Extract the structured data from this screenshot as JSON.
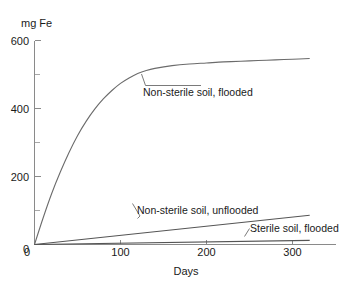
{
  "chart_data": {
    "type": "line",
    "title": "",
    "subtitle": "",
    "xlabel": "Days",
    "ylabel": "mg Fe",
    "xlim": [
      0,
      330
    ],
    "ylim": [
      0,
      620
    ],
    "grid": false,
    "legend_position": "inline-annotations",
    "x_ticks": [
      0,
      100,
      200,
      300
    ],
    "x_tick_labels": [
      "0",
      "100",
      "200",
      "300"
    ],
    "y_ticks": [
      0,
      200,
      400,
      600
    ],
    "y_tick_labels": [
      "0",
      "200",
      "400",
      "600"
    ],
    "y_minor_ticks": [
      100,
      300,
      500
    ],
    "series": [
      {
        "name": "Non-sterile soil, flooded",
        "label": "Non-sterile soil, flooded",
        "x": [
          0,
          10,
          20,
          30,
          40,
          50,
          60,
          70,
          80,
          90,
          100,
          110,
          120,
          130,
          140,
          160,
          180,
          200,
          220,
          240,
          260,
          280,
          300,
          320
        ],
        "values": [
          0,
          78,
          150,
          213,
          270,
          320,
          362,
          398,
          428,
          453,
          474,
          490,
          503,
          512,
          518,
          526,
          531,
          534,
          537,
          539,
          541,
          543,
          545,
          547
        ]
      },
      {
        "name": "Non-sterile soil, unflooded",
        "label": "Non-sterile soil, unflooded",
        "x": [
          0,
          320
        ],
        "values": [
          0,
          86
        ]
      },
      {
        "name": "Sterile soil, flooded",
        "label": "Sterile soil, flooded",
        "x": [
          0,
          320
        ],
        "values": [
          0,
          12
        ]
      }
    ],
    "annotations": [
      {
        "text": "Non-sterile soil, flooded",
        "target_x": 124,
        "target_y": 505,
        "text_x": 150,
        "text_y": 455
      },
      {
        "text": "Non-sterile soil, unflooded",
        "target_x": 108,
        "target_y": 29,
        "text_x": 140,
        "text_y": 108
      },
      {
        "text": "Sterile soil, flooded",
        "target_x": 250,
        "target_y": 9,
        "text_x": 262,
        "text_y": 55
      }
    ]
  },
  "axis": {
    "y_title": "mg Fe",
    "x_title": "Days",
    "y_labels": [
      "600",
      "400",
      "200",
      "0"
    ],
    "x_labels": [
      "0",
      "100",
      "200",
      "300"
    ]
  },
  "labels": {
    "flooded": "Non-sterile soil, flooded",
    "unflooded": "Non-sterile soil, unflooded",
    "sterile": "Sterile soil, flooded"
  },
  "colors": {
    "background": "#ffffff",
    "axis": "#8a8a8a",
    "curve": "#6b6b6b",
    "text": "#1a1a1a"
  }
}
